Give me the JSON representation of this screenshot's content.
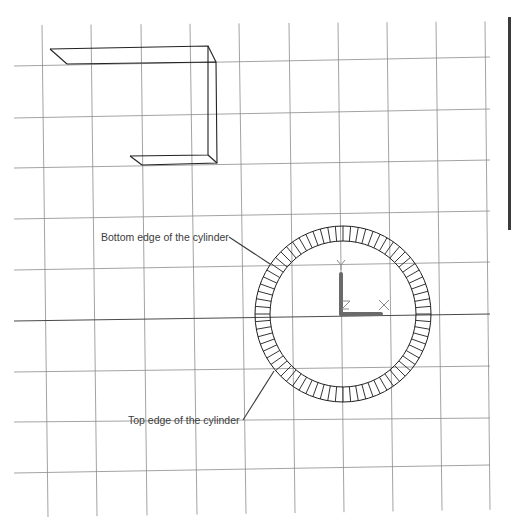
{
  "drawing": {
    "background": "#ffffff",
    "grid": {
      "color": "#8c8c8c",
      "vertical_top_x": [
        42,
        91,
        141,
        190,
        239,
        289,
        338,
        387,
        436,
        485
      ],
      "vertical_bottom_x": [
        48,
        97,
        147,
        197,
        246,
        295,
        344,
        393,
        442,
        490
      ],
      "horizontal_left_y": [
        66,
        118,
        168,
        219,
        270,
        321,
        372,
        422,
        473
      ],
      "horizontal_right_y": [
        57,
        109,
        160,
        211,
        262,
        314,
        366,
        418,
        465
      ]
    },
    "cylinder": {
      "center_x": 343,
      "center_y": 314,
      "outer_radius": 88,
      "inner_radius": 73,
      "segments": 72
    },
    "ucs_icon": {
      "origin_x": 341,
      "origin_y": 314,
      "y_label": "Y",
      "x_label": "X",
      "z_label": "Z",
      "arm_color": "#6a6a6a"
    },
    "annotations": [
      {
        "id": "bottom-edge",
        "text": "Bottom edge of the cylinder",
        "text_x": 101,
        "text_y": 241,
        "leader": [
          229,
          237,
          270,
          264
        ]
      },
      {
        "id": "top-edge",
        "text": "Top edge of the cylinder",
        "text_x": 128,
        "text_y": 424,
        "leader": [
          243,
          420,
          274,
          371
        ]
      }
    ],
    "c_shape": {
      "back": [
        [
          50,
          49
        ],
        [
          208,
          46
        ],
        [
          208,
          155
        ],
        [
          130,
          156
        ]
      ],
      "front": [
        [
          67,
          64
        ],
        [
          216,
          62
        ],
        [
          217,
          163
        ],
        [
          142,
          165
        ]
      ]
    }
  }
}
